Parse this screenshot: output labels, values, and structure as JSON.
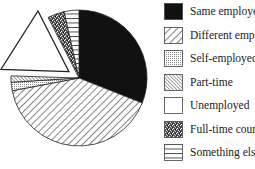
{
  "chart_data": {
    "type": "pie",
    "title": "",
    "start": "12 o'clock",
    "direction": "clockwise",
    "legend_position": "right",
    "slices": [
      {
        "label": "Same employer",
        "value": 31,
        "pattern": "solid-black",
        "exploded": false
      },
      {
        "label": "Different employer",
        "value": 41,
        "pattern": "diagonal-forward",
        "exploded": false
      },
      {
        "label": "Self-employed",
        "value": 2,
        "pattern": "dots",
        "exploded": false
      },
      {
        "label": "Part-time",
        "value": 1.5,
        "pattern": "diagonal-back",
        "exploded": false
      },
      {
        "label": "Unemployed",
        "value": 17,
        "pattern": "blank",
        "exploded": true
      },
      {
        "label": "Full-time course",
        "value": 4,
        "pattern": "speckled",
        "exploded": false
      },
      {
        "label": "Something else",
        "value": 3.5,
        "pattern": "horizontal-lines",
        "exploded": false
      }
    ]
  },
  "colors": {
    "ink": "#111111",
    "background": "#ffffff"
  }
}
